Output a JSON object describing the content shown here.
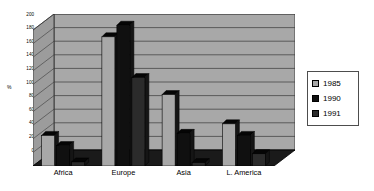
{
  "chart_data": {
    "type": "bar",
    "title": "",
    "xlabel": "",
    "ylabel": "%",
    "categories": [
      "Africa",
      "Europe",
      "Asia",
      "L. America"
    ],
    "series": [
      {
        "name": "1985",
        "color": "#a8a8a8",
        "values": [
          45,
          190,
          105,
          62
        ]
      },
      {
        "name": "1990",
        "color": "#101010",
        "values": [
          30,
          207,
          48,
          45
        ]
      },
      {
        "name": "1991",
        "color": "#2b2b2b",
        "values": [
          6,
          130,
          5,
          18
        ]
      }
    ],
    "ylim": [
      0,
      200
    ],
    "yticks": [
      0,
      20,
      40,
      60,
      80,
      100,
      120,
      140,
      160,
      180,
      200
    ],
    "ytick_labels": [
      "0",
      "20",
      "40",
      "60",
      "80",
      "100",
      "120",
      "140",
      "160",
      "180",
      "200"
    ],
    "grid": true,
    "legend_position": "right",
    "style": "3d-bar",
    "plot_background": "#a8a8a8",
    "wall_background": "#9c9c9c",
    "floor_color": "#1a1a1a",
    "gridline_color": "#3a3a3a",
    "legend_border_color": "#4d4d4d"
  },
  "legend": {
    "items": [
      {
        "label": "1985",
        "swatch": "#a8a8a8"
      },
      {
        "label": "1990",
        "swatch": "#101010"
      },
      {
        "label": "1991",
        "swatch": "#2b2b2b"
      }
    ]
  }
}
